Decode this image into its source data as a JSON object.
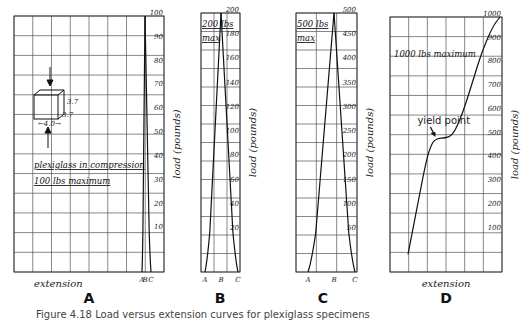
{
  "chart_data": [
    {
      "panel": "A",
      "type": "line",
      "title": "plexiglass in compression 100 lbs maximum",
      "annotations": [
        "plexiglass in compression",
        "100 lbs maximum",
        "4.0",
        "3.7",
        "3.7"
      ],
      "xlabel": "extension",
      "ylabel": "load (pounds)",
      "yticks": [
        10,
        20,
        30,
        40,
        50,
        60,
        70,
        80,
        90,
        100
      ],
      "ylim": [
        0,
        100
      ],
      "xtick_labels": [
        "A",
        "B",
        "C"
      ],
      "grid": true,
      "series": [
        {
          "name": "A-B rising",
          "x": [
            0.0,
            0.3,
            0.6,
            1.0
          ],
          "y": [
            0,
            10,
            40,
            100
          ]
        },
        {
          "name": "B-C falling",
          "x": [
            1.0,
            1.4,
            1.7,
            2.0
          ],
          "y": [
            100,
            40,
            10,
            0
          ]
        }
      ]
    },
    {
      "panel": "B",
      "type": "line",
      "title": "200 lbs max",
      "annotations": [
        "200 lbs",
        "max"
      ],
      "ylabel": "load (pounds)",
      "yticks": [
        20,
        40,
        60,
        80,
        100,
        120,
        140,
        160,
        180,
        200
      ],
      "ylim": [
        0,
        200
      ],
      "xtick_labels": [
        "A",
        "B",
        "C"
      ],
      "grid": true,
      "series": [
        {
          "name": "A-B rising",
          "x": [
            0.0,
            0.2,
            1.0
          ],
          "y": [
            0,
            10,
            200
          ]
        },
        {
          "name": "B-C falling",
          "x": [
            1.0,
            1.8,
            2.0
          ],
          "y": [
            200,
            10,
            0
          ]
        }
      ]
    },
    {
      "panel": "C",
      "type": "line",
      "title": "500 lbs max",
      "annotations": [
        "500 lbs",
        "max"
      ],
      "ylabel": "load (pounds)",
      "yticks": [
        50,
        100,
        150,
        200,
        250,
        300,
        350,
        400,
        450,
        500
      ],
      "ylim": [
        0,
        500
      ],
      "xtick_labels": [
        "A",
        "B",
        "C"
      ],
      "grid": true,
      "series": [
        {
          "name": "A-B rising",
          "x": [
            0.0,
            0.15,
            1.0
          ],
          "y": [
            0,
            50,
            500
          ]
        },
        {
          "name": "B-C falling",
          "x": [
            1.0,
            1.9,
            2.0
          ],
          "y": [
            500,
            50,
            0
          ]
        }
      ]
    },
    {
      "panel": "D",
      "type": "line",
      "title": "1000 lbs maximum",
      "annotations": [
        "1000 lbs maximum",
        "yield point"
      ],
      "xlabel": "extension",
      "ylabel": "load (pounds)",
      "yticks": [
        100,
        200,
        300,
        400,
        500,
        600,
        700,
        800,
        900,
        1000
      ],
      "ylim": [
        0,
        1000
      ],
      "grid": true,
      "series": [
        {
          "name": "stress-strain",
          "x": [
            0,
            0.5,
            1.0,
            1.3,
            1.6,
            2.0,
            2.4,
            2.8,
            3.2,
            3.6,
            4.0,
            4.6,
            5.0
          ],
          "y": [
            0,
            200,
            400,
            470,
            490,
            490,
            500,
            560,
            650,
            750,
            850,
            960,
            1000
          ]
        }
      ],
      "yield_point": {
        "x": 1.6,
        "y": 490
      }
    }
  ],
  "panels": {
    "A": {
      "label": "A",
      "ylabel": "load (pounds)",
      "xlabel": "extension",
      "note1": "plexiglass in compression",
      "note2": "100 lbs maximum",
      "dim_w": "4.0",
      "dim_h": "3.7",
      "dim_d": "3.7",
      "x_marks": [
        "A",
        "B",
        "C"
      ]
    },
    "B": {
      "label": "B",
      "ylabel": "load (pounds)",
      "note1": "200 lbs",
      "note2": "max",
      "x_marks": [
        "A",
        "B",
        "C"
      ]
    },
    "C": {
      "label": "C",
      "ylabel": "load (pounds)",
      "note1": "500 lbs",
      "note2": "max",
      "x_marks": [
        "A",
        "B",
        "C"
      ]
    },
    "D": {
      "label": "D",
      "ylabel": "load (pounds)",
      "xlabel": "extension",
      "note1": "1000 lbs maximum",
      "yield_label": "yield point"
    }
  },
  "caption": "Figure 4.18  Load versus extension curves for plexiglass specimens"
}
